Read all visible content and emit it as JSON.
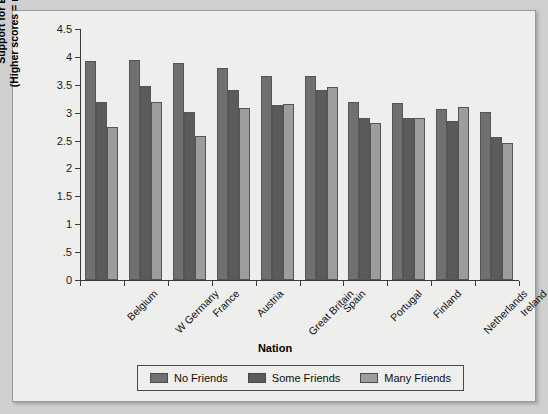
{
  "chart_data": {
    "type": "bar",
    "title": "",
    "xlabel": "Nation",
    "ylabel_line1": "Support for Exclusion",
    "ylabel_line2": "(Higher scores = more support)",
    "ylim": [
      0,
      4.5
    ],
    "ytick_labels": [
      "0",
      ".5",
      "1",
      "1.5",
      "2",
      "2.5",
      "3",
      "3.5",
      "4",
      "4.5"
    ],
    "ytick_values": [
      0,
      0.5,
      1,
      1.5,
      2,
      2.5,
      3,
      3.5,
      4,
      4.5
    ],
    "grid": false,
    "legend_position": "bottom",
    "categories": [
      "Belgium",
      "W Germany",
      "France",
      "Austria",
      "Great Britain",
      "Spain",
      "Portugal",
      "Finland",
      "Netherlands",
      "Ireland"
    ],
    "series": [
      {
        "name": "No Friends",
        "color": "#707070",
        "values": [
          3.93,
          3.94,
          3.89,
          3.81,
          3.65,
          3.66,
          3.19,
          3.18,
          3.07,
          3.01
        ]
      },
      {
        "name": "Some Friends",
        "color": "#5b5b5b",
        "values": [
          3.2,
          3.48,
          3.01,
          3.41,
          3.14,
          3.4,
          2.9,
          2.9,
          2.85,
          2.56
        ]
      },
      {
        "name": "Many Friends",
        "color": "#9d9d9d",
        "values": [
          2.75,
          3.2,
          2.58,
          3.09,
          3.16,
          3.46,
          2.81,
          2.91,
          3.1,
          2.46
        ]
      }
    ]
  },
  "legend": {
    "items": [
      {
        "label": "No Friends",
        "color": "#707070"
      },
      {
        "label": "Some Friends",
        "color": "#5b5b5b"
      },
      {
        "label": "Many Friends",
        "color": "#9d9d9d"
      }
    ]
  }
}
